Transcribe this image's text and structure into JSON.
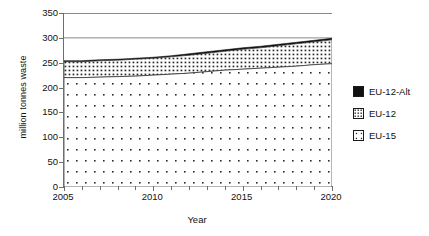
{
  "chart_data": {
    "type": "area",
    "stacked": true,
    "title": "",
    "xlabel": "Year",
    "ylabel": "million tonnes waste",
    "xlim": [
      2005,
      2020
    ],
    "ylim": [
      0,
      350
    ],
    "ytick_labels": [
      "0",
      "50",
      "100",
      "150",
      "200",
      "250",
      "300",
      "350"
    ],
    "ytick_values": [
      0,
      50,
      100,
      150,
      200,
      250,
      300,
      350
    ],
    "xtick_labels": [
      "2005",
      "2010",
      "2015",
      "2020"
    ],
    "xtick_values": [
      2005,
      2010,
      2015,
      2020
    ],
    "x_minor_tick_step": 1,
    "grid": "horizontal-major-only",
    "legend_position": "right",
    "x": [
      2005,
      2006,
      2007,
      2008,
      2009,
      2010,
      2011,
      2012,
      2013,
      2014,
      2015,
      2016,
      2017,
      2018,
      2019,
      2020
    ],
    "series": [
      {
        "name": "EU-15",
        "fill": "sparse-dot",
        "values": [
          220,
          220,
          221,
          222,
          223,
          225,
          227,
          229,
          232,
          235,
          237,
          239,
          241,
          243,
          246,
          248
        ]
      },
      {
        "name": "EU-12",
        "fill": "dense-dot",
        "values": [
          32,
          32,
          33,
          33,
          34,
          34,
          35,
          36,
          37,
          38,
          40,
          41,
          43,
          45,
          46,
          48
        ]
      },
      {
        "name": "EU-12-Alt",
        "fill": "solid-black",
        "values": [
          2,
          2,
          2,
          2,
          2,
          2,
          2,
          3,
          3,
          3,
          3,
          3,
          3,
          3,
          3,
          3
        ]
      }
    ],
    "cumulative_tops": {
      "EU-15": [
        220,
        220,
        221,
        222,
        223,
        225,
        227,
        229,
        232,
        235,
        237,
        239,
        241,
        243,
        246,
        248
      ],
      "EU-12": [
        252,
        252,
        254,
        255,
        257,
        259,
        262,
        265,
        269,
        273,
        277,
        280,
        284,
        288,
        292,
        296
      ],
      "EU-12-Alt": [
        254,
        254,
        256,
        257,
        259,
        261,
        264,
        268,
        272,
        276,
        280,
        283,
        287,
        291,
        295,
        299
      ]
    }
  },
  "legend": {
    "items": [
      {
        "label": "EU-12-Alt",
        "swatch": "solid-black"
      },
      {
        "label": "EU-12",
        "swatch": "dense-dot"
      },
      {
        "label": "EU-15",
        "swatch": "sparse-dot"
      }
    ]
  },
  "colors": {
    "axis": "#6e6e6e",
    "grid": "#8a8a8a",
    "ink": "#1a1a1a",
    "background": "#ffffff"
  }
}
